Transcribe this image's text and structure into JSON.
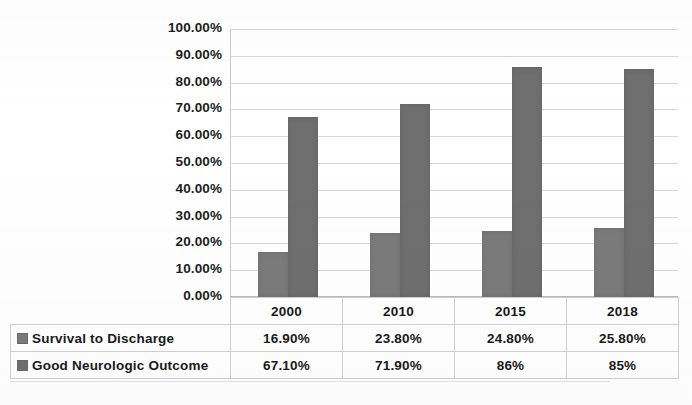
{
  "chart_data": {
    "type": "bar",
    "title": "",
    "xlabel": "",
    "ylabel": "",
    "categories": [
      "2000",
      "2010",
      "2015",
      "2018"
    ],
    "series": [
      {
        "name": "Survival to Discharge",
        "values": [
          16.9,
          23.8,
          24.8,
          25.8
        ],
        "labels": [
          "16.90%",
          "23.80%",
          "24.80%",
          "25.80%"
        ],
        "color": "#7b7b7b"
      },
      {
        "name": "Good Neurologic Outcome",
        "values": [
          67.1,
          71.9,
          86.0,
          85.0
        ],
        "labels": [
          "67.10%",
          "71.90%",
          "86%",
          "85%"
        ],
        "color": "#6f6f6f"
      }
    ],
    "ylim": [
      0,
      100
    ],
    "ytick_labels": [
      "100.00%",
      "90.00%",
      "80.00%",
      "70.00%",
      "60.00%",
      "50.00%",
      "40.00%",
      "30.00%",
      "20.00%",
      "10.00%",
      "0.00%"
    ],
    "ytick_values": [
      100,
      90,
      80,
      70,
      60,
      50,
      40,
      30,
      20,
      10,
      0
    ],
    "grid": true,
    "legend_position": "data-table",
    "data_table_visible": true
  },
  "table": {
    "header_row": [
      "",
      "2000",
      "2010",
      "2015",
      "2018"
    ],
    "rows": [
      {
        "label": "Survival to Discharge",
        "cells": [
          "16.90%",
          "23.80%",
          "24.80%",
          "25.80%"
        ]
      },
      {
        "label": "Good Neurologic Outcome",
        "cells": [
          "67.10%",
          "71.90%",
          "86%",
          "85%"
        ]
      }
    ]
  },
  "colors": {
    "series_1": "#7b7b7b",
    "series_2": "#6f6f6f",
    "gridline": "#d6d6d6",
    "table_border": "#d0d0d0",
    "text": "#1a1a1a"
  }
}
